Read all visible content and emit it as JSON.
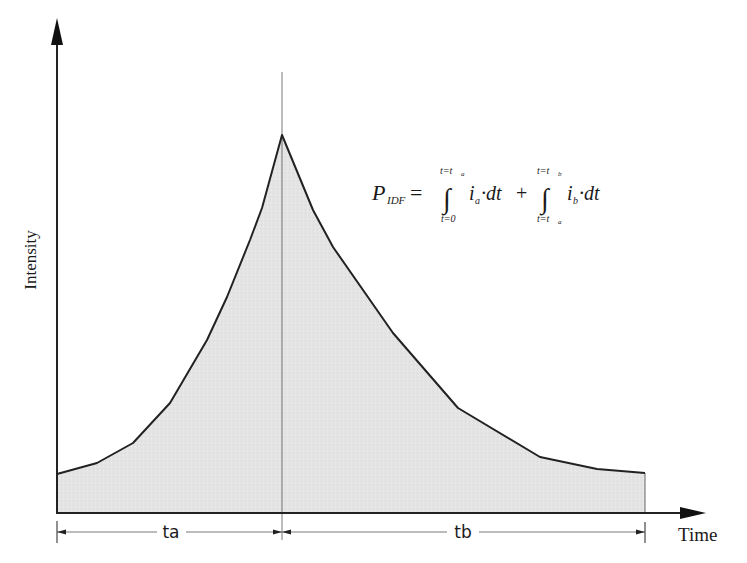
{
  "diagram": {
    "axes": {
      "y_label": "Intensity",
      "x_label": "Time"
    },
    "intervals": [
      {
        "label": "ta",
        "from_x": 57,
        "to_x": 282
      },
      {
        "label": "tb",
        "from_x": 282,
        "to_x": 645
      }
    ],
    "formula": {
      "lhs_symbol": "P",
      "lhs_subscript": "IDF",
      "equals": "=",
      "term1": {
        "upper_limit": "t=t",
        "upper_limit_sub": "a",
        "lower_limit": "t=0",
        "integrand": "i",
        "integrand_sub": "a",
        "differential": "·dt"
      },
      "plus": "+",
      "term2": {
        "upper_limit": "t=t",
        "upper_limit_sub": "b",
        "lower_limit": "t=t",
        "lower_limit_sub": "a",
        "integrand": "i",
        "integrand_sub": "b",
        "differential": "·dt"
      }
    },
    "curve_points": [
      [
        57,
        474
      ],
      [
        97,
        463
      ],
      [
        133,
        443
      ],
      [
        170,
        403
      ],
      [
        207,
        340
      ],
      [
        227,
        297
      ],
      [
        250,
        240
      ],
      [
        262,
        208
      ],
      [
        282,
        135
      ],
      [
        313,
        210
      ],
      [
        333,
        247
      ],
      [
        393,
        333
      ],
      [
        458,
        408
      ],
      [
        540,
        457
      ],
      [
        597,
        469
      ],
      [
        645,
        473
      ]
    ],
    "colors": {
      "fill": "#e6e6e6",
      "stroke": "#222222",
      "divider": "#555555"
    },
    "caption_fragment": ""
  }
}
